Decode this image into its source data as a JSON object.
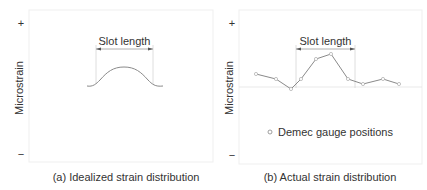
{
  "panels": [
    {
      "id": "a",
      "caption": "(a) Idealized strain distribution",
      "ylabel": "Microstrain",
      "y_plus": "+",
      "y_minus": "−",
      "slot_label": "Slot length",
      "curve": "idealized-bump"
    },
    {
      "id": "b",
      "caption": "(b) Actual strain distribution",
      "ylabel": "Microstrain",
      "y_plus": "+",
      "y_minus": "−",
      "slot_label": "Slot length",
      "legend": "Demec gauge positions",
      "points": [
        [
          256,
          74
        ],
        [
          276,
          79
        ],
        [
          291,
          89
        ],
        [
          301,
          79
        ],
        [
          316,
          59
        ],
        [
          331,
          54
        ],
        [
          348,
          79
        ],
        [
          363,
          84
        ],
        [
          383,
          79
        ],
        [
          399,
          84
        ]
      ]
    }
  ],
  "colors": {
    "line": "#8a8a8a",
    "frame": "#eeeeee",
    "text": "#333333",
    "guide": "#cfcfcf"
  }
}
